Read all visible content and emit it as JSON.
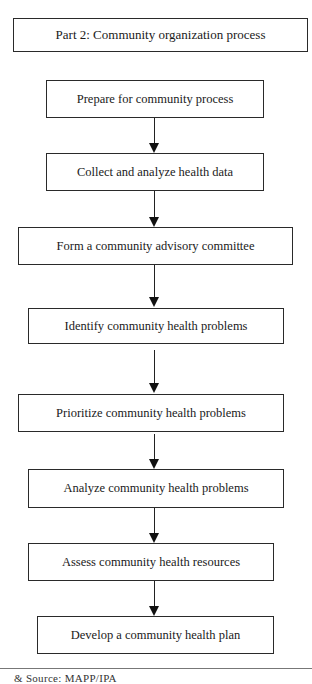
{
  "diagram": {
    "title": "Part 2: Community organization process",
    "steps": [
      {
        "label": "Prepare for community process"
      },
      {
        "label": "Collect and analyze health data"
      },
      {
        "label": "Form a community advisory committee"
      },
      {
        "label": "Identify community health problems"
      },
      {
        "label": "Prioritize community health problems"
      },
      {
        "label": "Analyze community health problems"
      },
      {
        "label": "Assess community health resources"
      },
      {
        "label": "Develop a community health plan"
      }
    ],
    "footnote": "& Source: MAPP/IPA"
  }
}
